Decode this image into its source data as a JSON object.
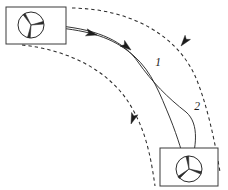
{
  "figure": {
    "type": "trajectory-diagram",
    "background_color": "#ffffff",
    "stroke_color": "#2b2b2b",
    "width": 228,
    "height": 190
  },
  "labels": {
    "trajectory_one": "1",
    "trajectory_two": "2"
  },
  "vehicles": [
    {
      "id": "ego-vehicle-start",
      "name": "top-left-vehicle",
      "box": {
        "x": 6,
        "y": 7,
        "width": 60,
        "height": 37
      },
      "wheel": {
        "cx": 31,
        "cy": 25,
        "r": 13
      }
    },
    {
      "id": "ego-vehicle-goal",
      "name": "bottom-right-vehicle",
      "box": {
        "x": 160,
        "y": 148,
        "width": 58,
        "height": 38
      },
      "wheel": {
        "cx": 189,
        "cy": 169,
        "r": 13
      }
    }
  ],
  "lane_boundaries": [
    {
      "id": "outer-lane-boundary",
      "style": "dashed",
      "path": "M 72 8 C 132 9 178 36 196 78 C 206 102 214 136 220 172"
    },
    {
      "id": "inner-lane-boundary",
      "style": "dashed",
      "path": "M 22 45 C 70 50 112 72 132 108 C 144 129 150 150 155 186"
    }
  ],
  "trajectories": [
    {
      "id": "trajectory-1",
      "label": "1",
      "style": "solid",
      "path": "M 60 28 C 96 32 116 40 134 56 C 152 72 160 94 170 118 C 178 138 183 155 186 168"
    },
    {
      "id": "trajectory-2",
      "label": "2",
      "style": "solid",
      "path": "M 60 26 C 100 30 124 42 138 62 C 152 82 168 98 186 112 C 200 124 196 148 190 168"
    }
  ],
  "direction_arrows": [
    {
      "id": "arrow-outer-lane",
      "x": 181,
      "y": 46,
      "angle": 128
    },
    {
      "id": "arrow-inner-lane",
      "x": 131,
      "y": 124,
      "angle": 110
    },
    {
      "id": "arrow-trajectory-entry",
      "x": 97,
      "y": 35,
      "angle": 14
    },
    {
      "id": "arrow-trajectory-mid",
      "x": 131,
      "y": 50,
      "angle": 38
    }
  ]
}
